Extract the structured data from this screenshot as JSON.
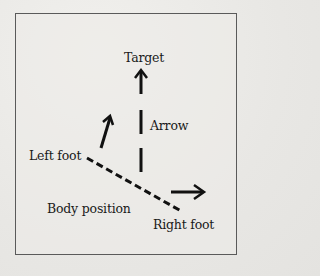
{
  "diagram": {
    "labels": {
      "target": "Target",
      "arrow": "Arrow",
      "left_foot": "Left foot",
      "body_position": "Body position",
      "right_foot": "Right foot"
    },
    "colors": {
      "ink": "#111111",
      "border": "#5a5a5a",
      "paper": "#ecebe8"
    }
  }
}
